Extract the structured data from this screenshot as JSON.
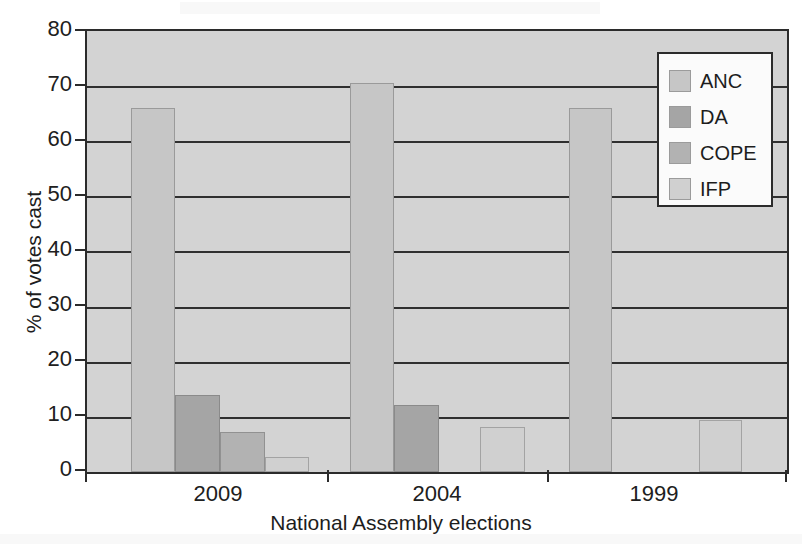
{
  "chart_data": {
    "type": "bar",
    "title": "",
    "xlabel": "National Assembly elections",
    "ylabel": "% of votes cast",
    "categories": [
      "2009",
      "2004",
      "1999"
    ],
    "series": [
      {
        "name": "ANC",
        "color": "#c6c6c6",
        "values": [
          66.0,
          70.6,
          66.0
        ]
      },
      {
        "name": "DA",
        "color": "#a5a5a5",
        "values": [
          14.0,
          12.2,
          null
        ]
      },
      {
        "name": "COPE",
        "color": "#b2b2b2",
        "values": [
          7.3,
          null,
          null
        ]
      },
      {
        "name": "IFP",
        "color": "#d0d0d0",
        "values": [
          2.7,
          8.2,
          9.4
        ]
      }
    ],
    "ylim": [
      0,
      80
    ],
    "yticks": [
      0,
      10,
      20,
      30,
      40,
      50,
      60,
      70,
      80
    ],
    "ytick_labels": [
      "0",
      "10",
      "20",
      "30",
      "40",
      "50",
      "60",
      "70",
      "80"
    ],
    "grid": true,
    "grid_axis": "y",
    "legend_position": "top-right",
    "plot_background": "#d3d3d3",
    "axis_color": "#2b2b2b"
  },
  "legend": {
    "entries": [
      {
        "label": "ANC"
      },
      {
        "label": "DA"
      },
      {
        "label": "COPE"
      },
      {
        "label": "IFP"
      }
    ]
  }
}
